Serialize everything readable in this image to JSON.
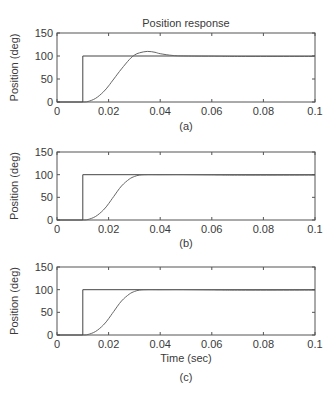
{
  "chart_data": [
    {
      "type": "line",
      "panel": "(a)",
      "title": "Position response",
      "xlabel": "",
      "ylabel": "Position (deg)",
      "xlim": [
        0,
        0.1
      ],
      "ylim": [
        0,
        150
      ],
      "xticks": [
        "0",
        "0.02",
        "0.04",
        "0.06",
        "0.08",
        "0.1"
      ],
      "yticks": [
        "0",
        "50",
        "100",
        "150"
      ],
      "caption": "(a)",
      "series": [
        {
          "name": "reference step",
          "x": [
            0,
            0.01,
            0.01,
            0.1
          ],
          "y": [
            0,
            0,
            100,
            100
          ]
        },
        {
          "name": "response",
          "x": [
            0.01,
            0.012,
            0.015,
            0.018,
            0.02,
            0.022,
            0.025,
            0.028,
            0.03,
            0.032,
            0.035,
            0.038,
            0.04,
            0.045,
            0.05,
            0.06,
            0.07,
            0.1
          ],
          "y": [
            0,
            1,
            8,
            22,
            35,
            50,
            72,
            92,
            102,
            107,
            110,
            108,
            105,
            101,
            100,
            99.5,
            99,
            99
          ]
        }
      ]
    },
    {
      "type": "line",
      "panel": "(b)",
      "title": "",
      "xlabel": "",
      "ylabel": "Position (deg)",
      "xlim": [
        0,
        0.1
      ],
      "ylim": [
        0,
        150
      ],
      "xticks": [
        "0",
        "0.02",
        "0.04",
        "0.06",
        "0.08",
        "0.1"
      ],
      "yticks": [
        "0",
        "50",
        "100",
        "150"
      ],
      "caption": "(b)",
      "series": [
        {
          "name": "reference step",
          "x": [
            0,
            0.01,
            0.01,
            0.1
          ],
          "y": [
            0,
            0,
            100,
            100
          ]
        },
        {
          "name": "response",
          "x": [
            0.01,
            0.012,
            0.015,
            0.018,
            0.02,
            0.022,
            0.025,
            0.028,
            0.03,
            0.032,
            0.035,
            0.04,
            0.05,
            0.06,
            0.07,
            0.1
          ],
          "y": [
            0,
            1,
            8,
            22,
            36,
            52,
            75,
            90,
            96,
            99,
            100,
            100,
            100,
            99.5,
            99,
            99
          ]
        }
      ]
    },
    {
      "type": "line",
      "panel": "(c)",
      "title": "",
      "xlabel": "Time (sec)",
      "ylabel": "Position (deg)",
      "xlim": [
        0,
        0.1
      ],
      "ylim": [
        0,
        150
      ],
      "xticks": [
        "0",
        "0.02",
        "0.04",
        "0.06",
        "0.08",
        "0.1"
      ],
      "yticks": [
        "0",
        "50",
        "100",
        "150"
      ],
      "caption": "(c)",
      "series": [
        {
          "name": "reference step",
          "x": [
            0,
            0.01,
            0.01,
            0.1
          ],
          "y": [
            0,
            0,
            100,
            100
          ]
        },
        {
          "name": "response",
          "x": [
            0.01,
            0.012,
            0.015,
            0.018,
            0.02,
            0.022,
            0.025,
            0.028,
            0.03,
            0.032,
            0.035,
            0.04,
            0.05,
            0.06,
            0.07,
            0.1
          ],
          "y": [
            0,
            1,
            8,
            22,
            36,
            52,
            75,
            90,
            96,
            99,
            100,
            100,
            100,
            99.5,
            99,
            99
          ]
        }
      ]
    }
  ],
  "labels": {
    "title": "Position response",
    "ylabel": "Position (deg)",
    "xlabel": "Time (sec)",
    "caption_a": "(a)",
    "caption_b": "(b)",
    "caption_c": "(c)"
  }
}
